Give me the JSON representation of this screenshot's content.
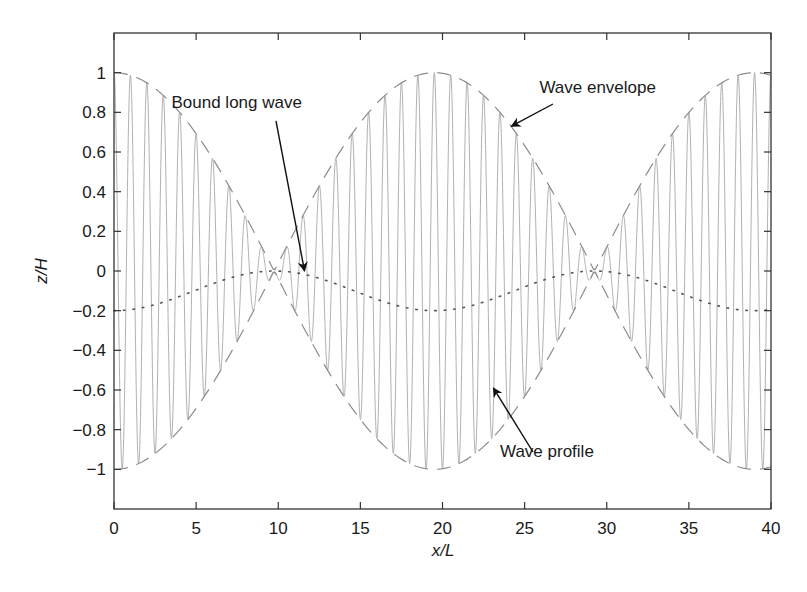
{
  "chart_data": {
    "type": "line",
    "title": "",
    "xlabel": "x/L",
    "ylabel": "z/H",
    "xlim": [
      0,
      40
    ],
    "ylim": [
      -1.2,
      1.2
    ],
    "xticks": [
      0,
      5,
      10,
      15,
      20,
      25,
      30,
      35,
      40
    ],
    "xtick_labels": [
      "0",
      "5",
      "10",
      "15",
      "20",
      "25",
      "30",
      "35",
      "40"
    ],
    "yticks": [
      1,
      0.8,
      0.6,
      0.4,
      0.2,
      0,
      -0.2,
      -0.4,
      -0.6,
      -0.8,
      -1
    ],
    "ytick_labels": [
      "1",
      "0.8",
      "0.6",
      "0.4",
      "0.2",
      "0",
      "−0.2",
      "−0.4",
      "−0.6",
      "−0.8",
      "−1"
    ],
    "grid": false,
    "legend": "none (annotations used instead)",
    "series": [
      {
        "name": "Wave profile",
        "style": "solid thin light gray",
        "formula": "z = cos(2*pi*x/envelope_period) * cos(2*pi*x/carrier_period)",
        "envelope_period": 39,
        "carrier_period": 1.0,
        "x_range": [
          0,
          40
        ],
        "color": "#a8a8a8"
      },
      {
        "name": "Wave envelope",
        "style": "dashed gray",
        "formula": "z = ±|cos(2*pi*x/envelope_period)|",
        "envelope_period": 39,
        "x_range": [
          0,
          40
        ],
        "color": "#8c8c8c",
        "sample_points": [
          {
            "x": 0,
            "upper": 1.0,
            "lower": -1.0
          },
          {
            "x": 5,
            "upper": 0.7,
            "lower": -0.7
          },
          {
            "x": 9.75,
            "upper": 0.0,
            "lower": 0.0
          },
          {
            "x": 15,
            "upper": 0.68,
            "lower": -0.68
          },
          {
            "x": 19.5,
            "upper": 1.0,
            "lower": -1.0
          },
          {
            "x": 25,
            "upper": 0.76,
            "lower": -0.76
          },
          {
            "x": 29.25,
            "upper": 0.0,
            "lower": 0.0
          },
          {
            "x": 35,
            "upper": 0.81,
            "lower": -0.81
          },
          {
            "x": 39,
            "upper": 1.0,
            "lower": -1.0
          }
        ]
      },
      {
        "name": "Bound long wave",
        "style": "dotted dark gray",
        "formula": "z = -0.1 - 0.1*cos(4*pi*x/envelope_period)",
        "envelope_period": 39,
        "x_range": [
          0,
          40
        ],
        "color": "#555555",
        "sample_points": [
          {
            "x": 0,
            "y": -0.2
          },
          {
            "x": 5,
            "y": -0.1
          },
          {
            "x": 9.75,
            "y": 0.0
          },
          {
            "x": 15,
            "y": -0.12
          },
          {
            "x": 19.5,
            "y": -0.2
          },
          {
            "x": 25,
            "y": -0.09
          },
          {
            "x": 29.25,
            "y": 0.0
          },
          {
            "x": 35,
            "y": -0.14
          },
          {
            "x": 39,
            "y": -0.2
          }
        ]
      }
    ],
    "annotations": [
      {
        "text": "Bound long wave",
        "label_pos": {
          "x": 3.5,
          "y": 0.82
        },
        "arrow_to": {
          "x": 11.6,
          "y": 0.0
        }
      },
      {
        "text": "Wave envelope",
        "label_pos": {
          "x": 25.9,
          "y": 0.9
        },
        "arrow_to": {
          "x": 24.2,
          "y": 0.73
        }
      },
      {
        "text": "Wave profile",
        "label_pos": {
          "x": 23.5,
          "y": -0.94
        },
        "arrow_to": {
          "x": 23.1,
          "y": -0.59
        }
      }
    ]
  },
  "layout": {
    "plot_px": {
      "left": 114,
      "right": 771,
      "top": 33,
      "bottom": 509
    },
    "colors": {
      "axes": "#333333",
      "profile": "#a8a8a8",
      "envelope": "#8c8c8c",
      "bound_wave": "#555555",
      "arrow": "#111111",
      "text": "#1a1a1a"
    }
  },
  "labels": {
    "xlabel": "x/L",
    "ylabel": "z/H",
    "annot_bound": "Bound long wave",
    "annot_envelope": "Wave envelope",
    "annot_profile": "Wave profile"
  }
}
